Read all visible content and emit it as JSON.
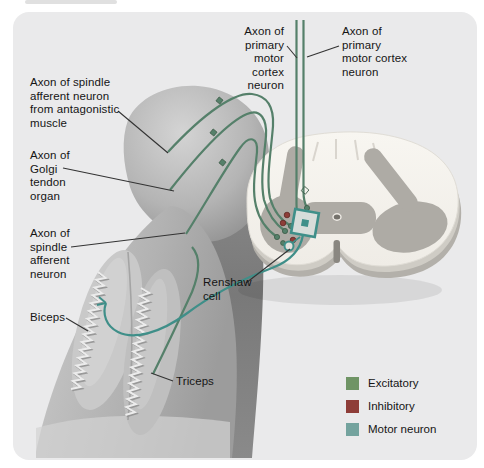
{
  "figure_labels": {
    "cortex_left": "Axon of\nprimary\nmotor cortex\nneuron",
    "cortex_right": "Axon of\nprimary\nmotor cortex\nneuron",
    "spindle_antagonistic": "Axon of spindle\nafferent neuron\nfrom antagonistic\nmuscle",
    "golgi": "Axon of\nGolgi\ntendon\norgan",
    "spindle": "Axon of\nspindle\nafferent\nneuron",
    "biceps": "Biceps",
    "triceps": "Triceps",
    "renshaw": "Renshaw\ncell"
  },
  "legend": {
    "items": [
      {
        "label": "Excitatory",
        "color": "#6f9465"
      },
      {
        "label": "Inhibitory",
        "color": "#8e3d38"
      },
      {
        "label": "Motor neuron",
        "color": "#74a39e"
      }
    ]
  },
  "colors": {
    "excitatory_line": "#55806a",
    "inhibitory": "#8e3d38",
    "motor_line": "#3f8f89",
    "leader_line": "#333333",
    "panel_bg": "#eaeaeb"
  }
}
